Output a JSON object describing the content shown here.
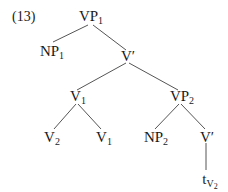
{
  "example_number": "(13)",
  "tree": {
    "nodes": {
      "vp1": {
        "base": "VP",
        "sub": "1"
      },
      "np1": {
        "base": "NP",
        "sub": "1"
      },
      "vbar1": {
        "base": "V′",
        "sub": ""
      },
      "v1_mid": {
        "base": "V",
        "sub": "1"
      },
      "vp2": {
        "base": "VP",
        "sub": "2"
      },
      "v2": {
        "base": "V",
        "sub": "2"
      },
      "v1_low": {
        "base": "V",
        "sub": "1"
      },
      "np2": {
        "base": "NP",
        "sub": "2"
      },
      "vbar2": {
        "base": "V′",
        "sub": ""
      },
      "trace": {
        "base": "t",
        "sub": "V",
        "subsub": "2"
      }
    },
    "edges": [
      [
        "vp1",
        "np1"
      ],
      [
        "vp1",
        "vbar1"
      ],
      [
        "vbar1",
        "v1_mid"
      ],
      [
        "vbar1",
        "vp2"
      ],
      [
        "v1_mid",
        "v2"
      ],
      [
        "v1_mid",
        "v1_low"
      ],
      [
        "vp2",
        "np2"
      ],
      [
        "vp2",
        "vbar2"
      ],
      [
        "vbar2",
        "trace"
      ]
    ]
  },
  "colors": {
    "ink": "#1a1a1a",
    "line": "#555555",
    "background": "#ffffff"
  }
}
